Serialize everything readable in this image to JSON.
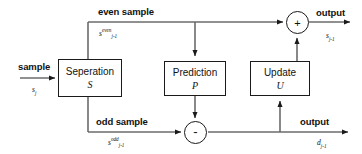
{
  "diagram": {
    "stroke_color": "#1a1a1a",
    "background": "#ffffff",
    "blocks": [
      {
        "id": "separation",
        "title": "Seperation",
        "symbol": "S"
      },
      {
        "id": "prediction",
        "title": "Prediction",
        "symbol": "P"
      },
      {
        "id": "update",
        "title": "Update",
        "symbol": "U"
      }
    ],
    "operators": [
      {
        "id": "sum-node",
        "sign": "+"
      },
      {
        "id": "difference-node",
        "sign": "-"
      }
    ],
    "labels": {
      "input_sample": "sample",
      "input_signal": "s",
      "input_signal_sub": "j",
      "even_sample": "even sample",
      "even_signal": "s",
      "even_signal_sup": "even",
      "even_signal_sub": "j-1",
      "odd_sample": "odd sample",
      "odd_signal": "s",
      "odd_signal_sup": "odd",
      "odd_signal_sub": "j-1",
      "output_top": "output",
      "output_top_signal": "s",
      "output_top_signal_sub": "j-1",
      "output_bottom": "output",
      "output_bottom_signal": "d",
      "output_bottom_signal_sub": "j-1"
    }
  }
}
